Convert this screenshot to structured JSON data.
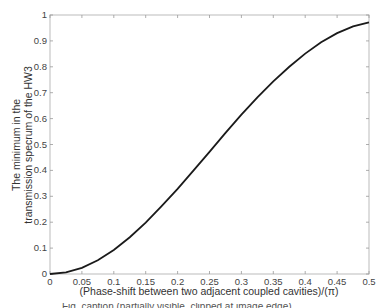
{
  "chart_data": {
    "type": "line",
    "title": "",
    "xlabel": "(Phase-shift between two adjacent coupled cavities)/(π)",
    "ylabel_lines": [
      "The minimum in the",
      "transmission specrum of the HW3"
    ],
    "xlim": [
      0,
      0.5
    ],
    "ylim": [
      0,
      1
    ],
    "x_ticks": [
      "0",
      "0.05",
      "0.1",
      "0.15",
      "0.2",
      "0.25",
      "0.3",
      "0.35",
      "0.4",
      "0.45",
      "0.5"
    ],
    "y_ticks": [
      "0",
      "0.1",
      "0.2",
      "0.3",
      "0.4",
      "0.5",
      "0.6",
      "0.7",
      "0.8",
      "0.9",
      "1"
    ],
    "grid": false,
    "legend": null,
    "series": [
      {
        "name": "minimum transmission",
        "color": "#1a1a1a",
        "x": [
          0,
          0.025,
          0.05,
          0.075,
          0.1,
          0.125,
          0.15,
          0.175,
          0.2,
          0.225,
          0.25,
          0.275,
          0.3,
          0.325,
          0.35,
          0.375,
          0.4,
          0.425,
          0.45,
          0.475,
          0.5
        ],
        "y": [
          0,
          0.006,
          0.024,
          0.053,
          0.093,
          0.142,
          0.198,
          0.262,
          0.329,
          0.4,
          0.472,
          0.545,
          0.615,
          0.682,
          0.744,
          0.8,
          0.851,
          0.895,
          0.93,
          0.956,
          0.972
        ]
      }
    ]
  },
  "footer": {
    "clipped_caption": "Fig. caption (partially visible, clipped at image edge)"
  }
}
